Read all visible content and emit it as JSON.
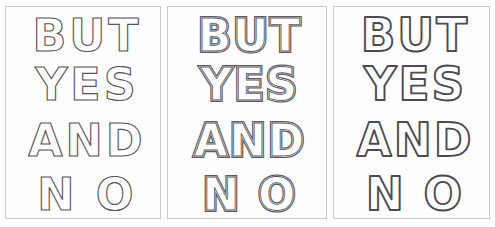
{
  "artwork": {
    "title": "BUT YES AND NO",
    "background_color": "#fdfdfd",
    "panel_background": "#fefefe",
    "panel_border_color": "#c9c9cc",
    "stroke_color": "#4a4a52",
    "panel_count": 3
  },
  "text_lines": {
    "line1": "BUT",
    "line2": "YES",
    "line3": "AND",
    "line4": "N O"
  },
  "panels": [
    {
      "index": 1,
      "style_name": "thin-outline",
      "style_label": "Thin single outline",
      "lines": [
        "BUT",
        "YES",
        "AND",
        "N O"
      ]
    },
    {
      "index": 2,
      "style_name": "double-inline-outline",
      "style_label": "Double inline outline",
      "lines": [
        "BUT",
        "YES",
        "AND",
        "N O"
      ]
    },
    {
      "index": 3,
      "style_name": "bold-rounded-outline",
      "style_label": "Bold rounded outline",
      "lines": [
        "BUT",
        "YES",
        "AND",
        "N O"
      ]
    }
  ]
}
